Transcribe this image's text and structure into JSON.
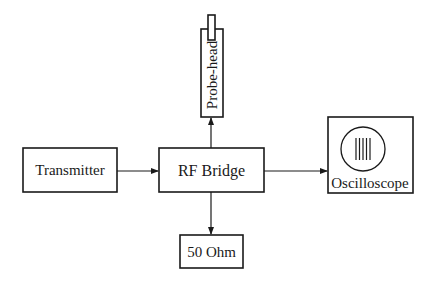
{
  "diagram": {
    "type": "block-diagram",
    "blocks": {
      "transmitter": {
        "label": "Transmitter"
      },
      "rf_bridge": {
        "label": "RF Bridge"
      },
      "probe_head": {
        "label": "Probe-head"
      },
      "oscilloscope": {
        "label": "Oscilloscope"
      },
      "load": {
        "label": "50 Ohm"
      }
    },
    "connections": [
      {
        "from": "Transmitter",
        "to": "RF Bridge"
      },
      {
        "from": "RF Bridge",
        "to": "Probe-head"
      },
      {
        "from": "RF Bridge",
        "to": "Oscilloscope"
      },
      {
        "from": "RF Bridge",
        "to": "50 Ohm"
      }
    ],
    "colors": {
      "stroke": "#1a1a1a",
      "background": "#ffffff"
    }
  }
}
